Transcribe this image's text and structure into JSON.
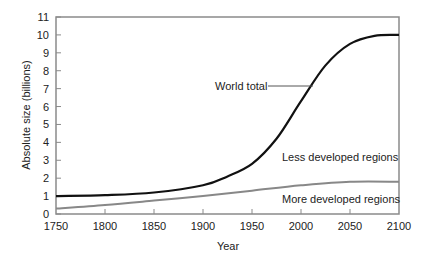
{
  "chart_data": {
    "type": "line",
    "title": "",
    "xlabel": "Year",
    "ylabel": "Absolute size (billions)",
    "xlim": [
      1750,
      2100
    ],
    "ylim": [
      0,
      11
    ],
    "x_ticks": [
      "1750",
      "1800",
      "1850",
      "1900",
      "1950",
      "2000",
      "2050",
      "2100"
    ],
    "y_ticks": [
      "0",
      "1",
      "2",
      "3",
      "4",
      "5",
      "6",
      "7",
      "8",
      "9",
      "10",
      "11"
    ],
    "grid": false,
    "series": [
      {
        "name": "World total",
        "color": "#111111",
        "x": [
          1750,
          1800,
          1850,
          1900,
          1925,
          1950,
          1975,
          2000,
          2025,
          2050,
          2075,
          2100
        ],
        "values": [
          1.0,
          1.05,
          1.2,
          1.6,
          2.1,
          2.8,
          4.2,
          6.3,
          8.3,
          9.5,
          9.95,
          10.0
        ]
      },
      {
        "name": "More developed regions",
        "color": "#888888",
        "x": [
          1750,
          1800,
          1850,
          1900,
          1950,
          2000,
          2050,
          2100
        ],
        "values": [
          0.3,
          0.5,
          0.75,
          1.0,
          1.3,
          1.6,
          1.8,
          1.8
        ]
      }
    ],
    "annotations": [
      {
        "text": "World total",
        "x_approx": 1975,
        "y_approx": 7.2,
        "leader_line": true
      },
      {
        "text": "Less developed regions",
        "x_approx": 2040,
        "y_approx": 3.2
      },
      {
        "text": "More developed regions",
        "x_approx": 2040,
        "y_approx": 1.0
      }
    ]
  }
}
